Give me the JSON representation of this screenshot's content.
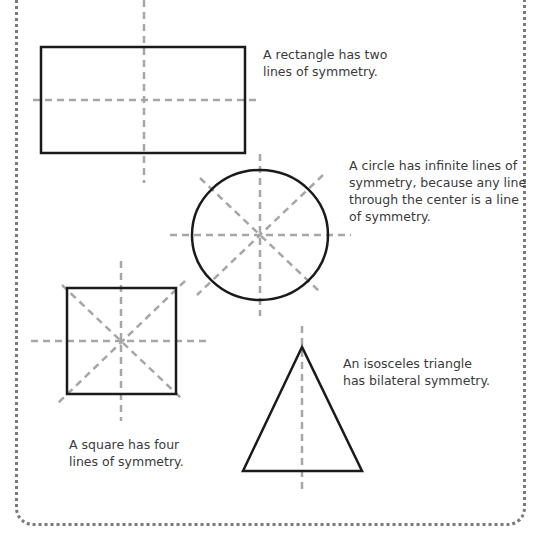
{
  "diagram": {
    "topic": "Lines of symmetry",
    "colors": {
      "shape_stroke": "#1a1a1a",
      "symmetry_line": "#a6a6a6",
      "border": "#7a7a7a",
      "text": "#3a3a3a"
    },
    "shapes": [
      {
        "name": "rectangle",
        "lines_of_symmetry": 2,
        "caption": "A rectangle has two\nlines of symmetry."
      },
      {
        "name": "circle",
        "lines_of_symmetry": "infinite",
        "caption": "A circle has infinite lines of\nsymmetry, because any line\nthrough the center is a line\nof symmetry."
      },
      {
        "name": "square",
        "lines_of_symmetry": 4,
        "caption": "A square has four\nlines of symmetry."
      },
      {
        "name": "isosceles-triangle",
        "lines_of_symmetry": 1,
        "caption": "An isosceles triangle\nhas bilateral symmetry."
      }
    ]
  }
}
